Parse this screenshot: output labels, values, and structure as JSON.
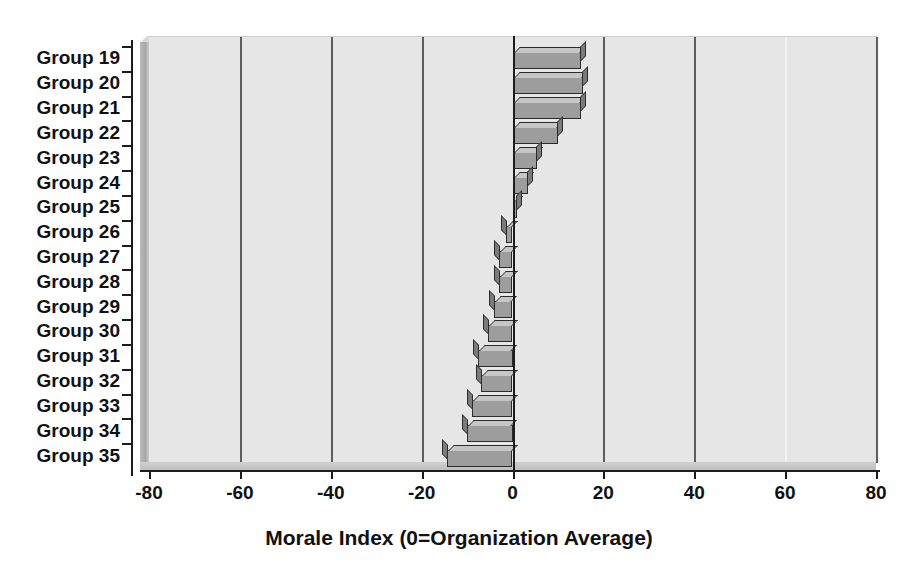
{
  "chart_data": {
    "type": "bar",
    "orientation": "horizontal",
    "title": "",
    "xlabel": "Morale Index (0=Organization Average)",
    "ylabel": "",
    "categories": [
      "Group 19",
      "Group 20",
      "Group 21",
      "Group 22",
      "Group 23",
      "Group 24",
      "Group 25",
      "Group 26",
      "Group 27",
      "Group 28",
      "Group 29",
      "Group 30",
      "Group 31",
      "Group 32",
      "Group 33",
      "Group 34",
      "Group 35"
    ],
    "values": [
      15,
      15.5,
      15,
      10,
      5.5,
      3.5,
      1,
      -1.5,
      -3,
      -3,
      -4,
      -5.5,
      -7.5,
      -7,
      -9,
      -10,
      -14.5
    ],
    "xlim": [
      -80,
      80
    ],
    "xticks": [
      -80,
      -60,
      -40,
      -20,
      0,
      20,
      40,
      60,
      80
    ],
    "xticklabels": [
      "-80",
      "-60",
      "-40",
      "-20",
      "0",
      "20",
      "40",
      "60",
      "80"
    ],
    "grid": true,
    "grid_axis": "x",
    "legend": false,
    "style": "3d-shaded-gray",
    "colors": {
      "bar_face": "#9d9d9d",
      "bar_top": "#c6c6c6",
      "bar_side": "#7b7b7b",
      "bar_outline": "#2b2b2b",
      "plot_background": "#e6e6e6",
      "gridline": "#5d5d5d",
      "axis": "#1c1c1c",
      "wall": "#a8a8a8",
      "page_background": "#ffffff",
      "text": "#111111"
    }
  }
}
